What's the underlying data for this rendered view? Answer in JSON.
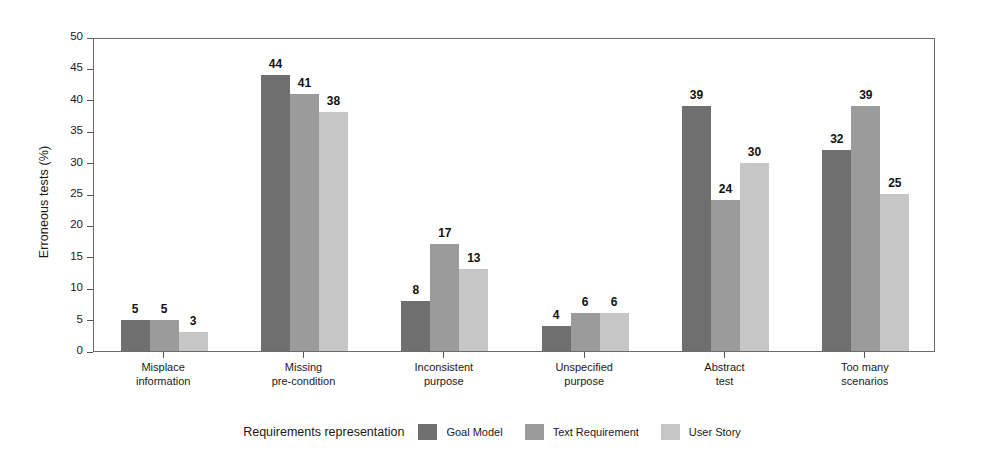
{
  "chart_data": {
    "type": "bar",
    "title": "",
    "xlabel": "",
    "ylabel": "Erroneous tests (%)",
    "ylim": [
      0,
      50
    ],
    "ytick_step": 5,
    "yticks": [
      0,
      5,
      10,
      15,
      20,
      25,
      30,
      35,
      40,
      45,
      50
    ],
    "grid": false,
    "legend_position": "bottom",
    "legend_title": "Requirements representation",
    "categories": [
      "Misplace information",
      "Missing pre-condition",
      "Inconsistent purpose",
      "Unspecified purpose",
      "Abstract test",
      "Too many scenarios"
    ],
    "category_lines": [
      [
        "Misplace",
        "information"
      ],
      [
        "Missing",
        "pre-condition"
      ],
      [
        "Inconsistent",
        "purpose"
      ],
      [
        "Unspecified",
        "purpose"
      ],
      [
        "Abstract",
        "test"
      ],
      [
        "Too many",
        "scenarios"
      ]
    ],
    "series": [
      {
        "name": "Goal Model",
        "color": "#6f6f6f",
        "values": [
          5,
          44,
          8,
          4,
          39,
          32
        ]
      },
      {
        "name": "Text Requirement",
        "color": "#9b9b9b",
        "values": [
          5,
          41,
          17,
          6,
          24,
          39
        ]
      },
      {
        "name": "User Story",
        "color": "#c6c6c6",
        "values": [
          3,
          38,
          13,
          6,
          30,
          25
        ]
      }
    ]
  },
  "axes": {
    "y_title": "Erroneous tests (%)"
  },
  "legend": {
    "title": "Requirements representation",
    "items": [
      {
        "label": "Goal Model"
      },
      {
        "label": "Text Requirement"
      },
      {
        "label": "User Story"
      }
    ]
  }
}
